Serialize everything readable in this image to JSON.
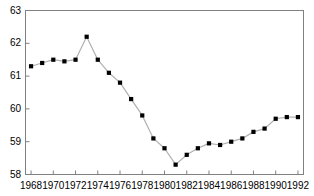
{
  "chart_data": {
    "type": "line",
    "title": "",
    "subtitle": "",
    "xlabel": "",
    "ylabel": "",
    "grid": false,
    "legend": "none",
    "marker": "square",
    "marker_color": "#000000",
    "line_color": "#b0b0b0",
    "axis_color": "#808080",
    "background": "#ffffff",
    "xlim": [
      1967.5,
      1992.5
    ],
    "ylim": [
      58,
      63
    ],
    "xticks": [
      1968,
      1970,
      1972,
      1974,
      1976,
      1978,
      1980,
      1982,
      1984,
      1986,
      1988,
      1990,
      1992
    ],
    "xtick_labels": [
      "1968",
      "1970",
      "1972",
      "1974",
      "1976",
      "1978",
      "1980",
      "1982",
      "1984",
      "1986",
      "1988",
      "1990",
      "1992"
    ],
    "yticks": [
      58,
      59,
      60,
      61,
      62,
      63
    ],
    "ytick_labels": [
      "58",
      "59",
      "60",
      "61",
      "62",
      "63"
    ],
    "x": [
      1968,
      1969,
      1970,
      1971,
      1972,
      1973,
      1974,
      1975,
      1976,
      1977,
      1978,
      1979,
      1980,
      1981,
      1982,
      1983,
      1984,
      1985,
      1986,
      1987,
      1988,
      1989,
      1990,
      1991,
      1992
    ],
    "values": [
      61.3,
      61.4,
      61.5,
      61.45,
      61.5,
      62.2,
      61.5,
      61.1,
      60.8,
      60.3,
      59.8,
      59.1,
      58.8,
      58.3,
      58.6,
      58.8,
      58.95,
      58.9,
      59.0,
      59.1,
      59.3,
      59.4,
      59.7,
      59.75,
      59.75
    ],
    "series": [
      {
        "name": "series-1",
        "values": [
          61.3,
          61.4,
          61.5,
          61.45,
          61.5,
          62.2,
          61.5,
          61.1,
          60.8,
          60.3,
          59.8,
          59.1,
          58.8,
          58.3,
          58.6,
          58.8,
          58.95,
          58.9,
          59.0,
          59.1,
          59.3,
          59.4,
          59.7,
          59.75,
          59.75
        ]
      }
    ]
  }
}
